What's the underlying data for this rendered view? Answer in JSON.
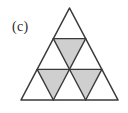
{
  "figure": {
    "panel_label": "(c)",
    "colors": {
      "stroke": "#3a3a3a",
      "shaded_fill": "#cfcfcf",
      "unshaded_fill": "#ffffff",
      "background": "#ffffff",
      "label_text": "#2b2b2b"
    },
    "geometry": {
      "apex": [
        70,
        8
      ],
      "base_left": [
        21,
        100
      ],
      "base_right": [
        118,
        100
      ],
      "rows": 3,
      "small_triangle_count": 9,
      "upright_count": 6,
      "inverted_count": 3,
      "shaded_count": 3,
      "stroke_width": 1.4
    },
    "cells": [
      {
        "id": "r1-up-1",
        "row": 1,
        "index": 1,
        "orientation": "up",
        "shaded": false
      },
      {
        "id": "r2-up-1",
        "row": 2,
        "index": 1,
        "orientation": "up",
        "shaded": false
      },
      {
        "id": "r2-down-1",
        "row": 2,
        "index": 2,
        "orientation": "down",
        "shaded": true
      },
      {
        "id": "r2-up-2",
        "row": 2,
        "index": 3,
        "orientation": "up",
        "shaded": false
      },
      {
        "id": "r3-up-1",
        "row": 3,
        "index": 1,
        "orientation": "up",
        "shaded": false
      },
      {
        "id": "r3-down-1",
        "row": 3,
        "index": 2,
        "orientation": "down",
        "shaded": true
      },
      {
        "id": "r3-up-2",
        "row": 3,
        "index": 3,
        "orientation": "up",
        "shaded": false
      },
      {
        "id": "r3-down-2",
        "row": 3,
        "index": 4,
        "orientation": "down",
        "shaded": true
      },
      {
        "id": "r3-up-3",
        "row": 3,
        "index": 5,
        "orientation": "up",
        "shaded": false
      }
    ]
  }
}
